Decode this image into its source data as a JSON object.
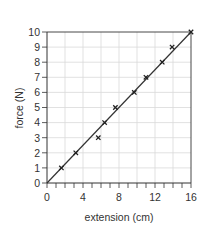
{
  "chart_data": {
    "type": "scatter",
    "title": "",
    "xlabel": "extension (cm)",
    "ylabel": "force (N)",
    "xlim": [
      0,
      16
    ],
    "ylim": [
      0,
      10
    ],
    "x_ticks": [
      0,
      4,
      8,
      12,
      16
    ],
    "x_minor_tick_step": 1,
    "x_grid_step": 2,
    "y_ticks": [
      0,
      1,
      2,
      3,
      4,
      5,
      6,
      7,
      8,
      9,
      10
    ],
    "y_grid_step": 1,
    "grid": true,
    "legend": null,
    "series": [
      {
        "name": "measurements",
        "marker": "x",
        "points": [
          {
            "x": 1.6,
            "y": 1
          },
          {
            "x": 3.2,
            "y": 2
          },
          {
            "x": 5.7,
            "y": 3
          },
          {
            "x": 6.4,
            "y": 4
          },
          {
            "x": 7.6,
            "y": 5
          },
          {
            "x": 9.7,
            "y": 6
          },
          {
            "x": 11.0,
            "y": 7
          },
          {
            "x": 12.8,
            "y": 8
          },
          {
            "x": 13.9,
            "y": 9
          },
          {
            "x": 16.0,
            "y": 10
          }
        ]
      }
    ],
    "best_fit_line": {
      "from": {
        "x": 0,
        "y": 0
      },
      "to": {
        "x": 16,
        "y": 10
      }
    }
  },
  "colors": {
    "axis": "#333333",
    "grid": "#d9d9d9",
    "line": "#333333",
    "marker": "#222222",
    "text": "#333333"
  }
}
